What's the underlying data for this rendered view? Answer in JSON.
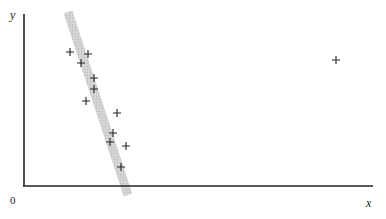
{
  "chart_data": {
    "type": "scatter",
    "title": "",
    "xlabel": "x",
    "ylabel": "y",
    "origin_label": "0",
    "grid": false,
    "legend": null,
    "annotations": [
      "shaded band along steep negatively-sloped trend of clustered points"
    ],
    "points_px": [
      [
        70,
        52
      ],
      [
        88,
        54
      ],
      [
        81,
        63
      ],
      [
        94,
        78
      ],
      [
        94,
        89
      ],
      [
        86,
        101
      ],
      [
        117,
        113
      ],
      [
        113,
        133
      ],
      [
        110,
        142
      ],
      [
        126,
        146
      ],
      [
        121,
        167
      ],
      [
        336,
        60
      ]
    ],
    "points_approx": [
      {
        "x": 0.13,
        "y": 0.78
      },
      {
        "x": 0.18,
        "y": 0.77
      },
      {
        "x": 0.16,
        "y": 0.72
      },
      {
        "x": 0.2,
        "y": 0.63
      },
      {
        "x": 0.2,
        "y": 0.56
      },
      {
        "x": 0.18,
        "y": 0.49
      },
      {
        "x": 0.27,
        "y": 0.42
      },
      {
        "x": 0.26,
        "y": 0.3
      },
      {
        "x": 0.25,
        "y": 0.25
      },
      {
        "x": 0.29,
        "y": 0.23
      },
      {
        "x": 0.28,
        "y": 0.11
      },
      {
        "x": 0.9,
        "y": 0.73
      }
    ],
    "band": {
      "from_px": [
        68,
        12
      ],
      "to_px": [
        128,
        195
      ],
      "width_px": 9,
      "color": "#c8c8c8"
    },
    "outlier": {
      "x": 0.9,
      "y": 0.73
    }
  },
  "labels": {
    "x_axis": "x",
    "y_axis": "y",
    "origin": "0"
  }
}
